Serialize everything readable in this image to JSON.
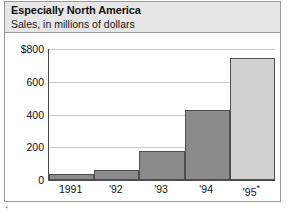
{
  "chart_data": {
    "type": "bar",
    "title": "Especially North America",
    "subtitle": "Sales, in millions of dollars",
    "xlabel": "",
    "ylabel": "",
    "categories": [
      "1991",
      "'92",
      "'93",
      "'94",
      "'95*"
    ],
    "values": [
      35,
      60,
      180,
      430,
      745
    ],
    "ylim": [
      0,
      800
    ],
    "yticks": [
      "$800",
      "600",
      "400",
      "200",
      "0"
    ],
    "ytick_values": [
      800,
      600,
      400,
      200,
      0
    ],
    "grid": true,
    "legend": "none",
    "colors": {
      "bar_actual": "#8a8a8a",
      "bar_projected": "#d0d0d0",
      "bar_outline": "#4f4f4f",
      "gridline": "#c8c8c8",
      "axis": "#4a4a4a",
      "header_band": "#e6e6e6",
      "frame": "#9a9a9a",
      "text": "#111111"
    },
    "bar_styles": [
      "actual",
      "actual",
      "actual",
      "actual",
      "projected"
    ],
    "annotations": [
      "* projected"
    ],
    "footnote_mark": "*"
  }
}
